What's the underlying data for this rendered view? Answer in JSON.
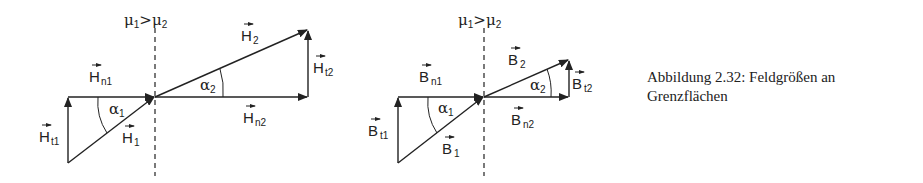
{
  "caption": {
    "line1": "Abbildung 2.32: Feldgrößen an",
    "line2": "Grenzflächen"
  },
  "diagrams": [
    {
      "id": "H-field",
      "interface_label": {
        "mu1": "μ",
        "s1": "1",
        "gt": ">",
        "mu2": "μ",
        "s2": "2"
      },
      "labels": {
        "n1": {
          "base": "H",
          "sub": "n1"
        },
        "t1": {
          "base": "H",
          "sub": "t1"
        },
        "v1": {
          "base": "H",
          "sub": "1"
        },
        "v2": {
          "base": "H",
          "sub": "2"
        },
        "n2": {
          "base": "H",
          "sub": "n2"
        },
        "t2": {
          "base": "H",
          "sub": "t2"
        },
        "a1": {
          "base": "α",
          "sub": "1"
        },
        "a2": {
          "base": "α",
          "sub": "2"
        }
      }
    },
    {
      "id": "B-field",
      "interface_label": {
        "mu1": "μ",
        "s1": "1",
        "gt": ">",
        "mu2": "μ",
        "s2": "2"
      },
      "labels": {
        "n1": {
          "base": "B",
          "sub": "n1"
        },
        "t1": {
          "base": "B",
          "sub": "t1"
        },
        "v1": {
          "base": "B",
          "sub": "1"
        },
        "v2": {
          "base": "B",
          "sub": "2"
        },
        "n2": {
          "base": "B",
          "sub": "n2"
        },
        "t2": {
          "base": "B",
          "sub": "t2"
        },
        "a1": {
          "base": "α",
          "sub": "1"
        },
        "a2": {
          "base": "α",
          "sub": "2"
        }
      }
    }
  ]
}
